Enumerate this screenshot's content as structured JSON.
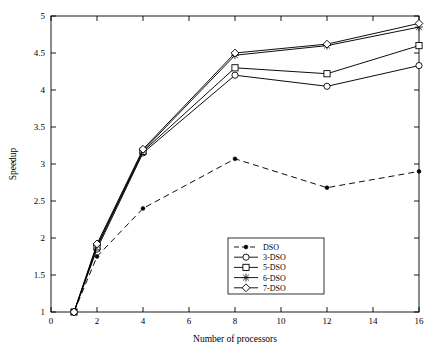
{
  "chart_data": {
    "type": "line",
    "title": "",
    "xlabel": "Number of processors",
    "ylabel": "Speedup",
    "x": [
      1,
      2,
      4,
      8,
      12,
      16
    ],
    "xlim": [
      0,
      16
    ],
    "ylim": [
      1,
      5
    ],
    "xticks": [
      "0",
      "2",
      "4",
      "6",
      "8",
      "10",
      "12",
      "14",
      "16"
    ],
    "yticks": [
      "1",
      "1.5",
      "2",
      "2.5",
      "3",
      "3.5",
      "4",
      "4.5",
      "5"
    ],
    "grid": false,
    "legend_position": "bottom-center",
    "series": [
      {
        "name": "DSO",
        "marker": "dot",
        "line": "dashed",
        "values": [
          1.0,
          1.75,
          2.4,
          3.07,
          2.68,
          2.9
        ]
      },
      {
        "name": "3-DSO",
        "marker": "circle",
        "line": "solid",
        "values": [
          1.0,
          1.85,
          3.15,
          4.2,
          4.05,
          4.33
        ]
      },
      {
        "name": "5-DSO",
        "marker": "square",
        "line": "solid",
        "values": [
          1.0,
          1.88,
          3.17,
          4.3,
          4.22,
          4.6
        ]
      },
      {
        "name": "6-DSO",
        "marker": "star",
        "line": "solid",
        "values": [
          1.0,
          1.9,
          3.18,
          4.47,
          4.6,
          4.85
        ]
      },
      {
        "name": "7-DSO",
        "marker": "diamond",
        "line": "solid",
        "values": [
          1.0,
          1.92,
          3.2,
          4.5,
          4.62,
          4.9
        ]
      }
    ]
  }
}
